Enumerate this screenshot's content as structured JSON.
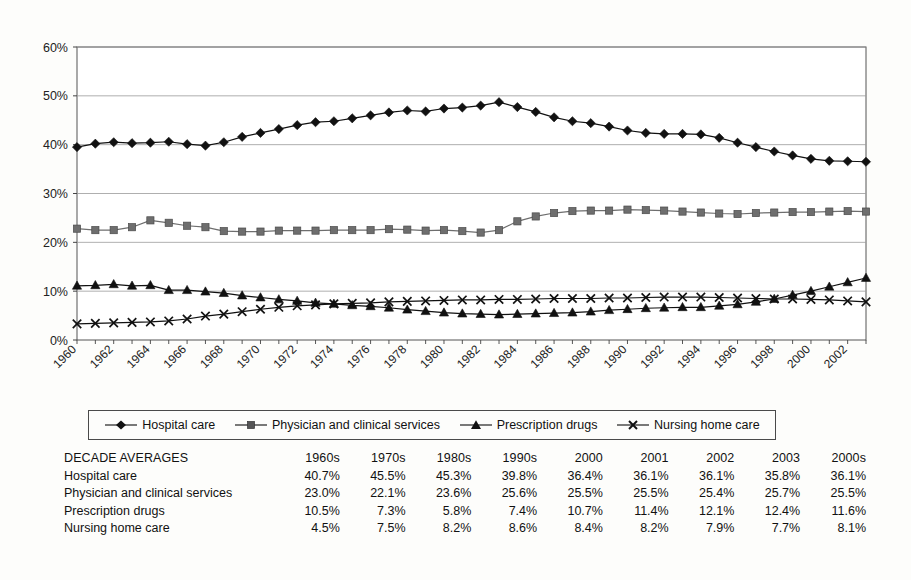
{
  "chart_data": {
    "type": "line",
    "title": "",
    "subtitle": "",
    "xlabel": "",
    "ylabel": "",
    "xlim": [
      1960,
      2003
    ],
    "ylim": [
      0,
      60
    ],
    "yticks": [
      "0%",
      "10%",
      "20%",
      "30%",
      "40%",
      "50%",
      "60%"
    ],
    "ytick_values": [
      0,
      10,
      20,
      30,
      40,
      50,
      60
    ],
    "grid": true,
    "legend_position": "below-plot",
    "x": [
      1960,
      1961,
      1962,
      1963,
      1964,
      1965,
      1966,
      1967,
      1968,
      1969,
      1970,
      1971,
      1972,
      1973,
      1974,
      1975,
      1976,
      1977,
      1978,
      1979,
      1980,
      1981,
      1982,
      1983,
      1984,
      1985,
      1986,
      1987,
      1988,
      1989,
      1990,
      1991,
      1992,
      1993,
      1994,
      1995,
      1996,
      1997,
      1998,
      1999,
      2000,
      2001,
      2002,
      2003
    ],
    "xtick_labels": [
      "1960",
      "1962",
      "1964",
      "1966",
      "1968",
      "1970",
      "1972",
      "1974",
      "1976",
      "1978",
      "1980",
      "1982",
      "1984",
      "1986",
      "1988",
      "1990",
      "1992",
      "1994",
      "1996",
      "1998",
      "2000",
      "2002"
    ],
    "series": [
      {
        "name": "Hospital care",
        "marker": "diamond",
        "color": "#111111",
        "values": [
          39.5,
          40.2,
          40.5,
          40.3,
          40.4,
          40.6,
          40.1,
          39.8,
          40.5,
          41.6,
          42.4,
          43.2,
          44.0,
          44.6,
          44.8,
          45.4,
          46.0,
          46.6,
          47.0,
          46.8,
          47.4,
          47.6,
          48.0,
          48.7,
          47.7,
          46.7,
          45.6,
          44.8,
          44.4,
          43.7,
          42.9,
          42.4,
          42.2,
          42.2,
          42.1,
          41.4,
          40.4,
          39.5,
          38.6,
          37.8,
          37.1,
          36.7,
          36.6,
          36.5
        ]
      },
      {
        "name": "Physician and clinical services",
        "marker": "square",
        "color": "#6e6e6e",
        "values": [
          22.8,
          22.5,
          22.5,
          23.1,
          24.5,
          24.0,
          23.4,
          23.1,
          22.3,
          22.2,
          22.2,
          22.4,
          22.4,
          22.4,
          22.5,
          22.5,
          22.5,
          22.7,
          22.6,
          22.4,
          22.5,
          22.3,
          22.0,
          22.5,
          24.3,
          25.3,
          26.0,
          26.4,
          26.5,
          26.5,
          26.7,
          26.6,
          26.5,
          26.3,
          26.1,
          25.9,
          25.8,
          26.0,
          26.1,
          26.2,
          26.2,
          26.3,
          26.4,
          26.3
        ]
      },
      {
        "name": "Prescription drugs",
        "marker": "triangle",
        "color": "#111111",
        "values": [
          11.1,
          11.2,
          11.4,
          11.1,
          11.2,
          10.2,
          10.2,
          9.9,
          9.6,
          9.1,
          8.7,
          8.3,
          8.0,
          7.6,
          7.4,
          7.1,
          6.9,
          6.6,
          6.2,
          5.9,
          5.6,
          5.4,
          5.3,
          5.2,
          5.3,
          5.4,
          5.5,
          5.6,
          5.8,
          6.1,
          6.3,
          6.5,
          6.6,
          6.7,
          6.7,
          7.0,
          7.3,
          7.8,
          8.4,
          9.2,
          10.0,
          10.9,
          11.8,
          12.7
        ]
      },
      {
        "name": "Nursing home care",
        "marker": "x",
        "color": "#111111",
        "values": [
          3.3,
          3.4,
          3.5,
          3.6,
          3.7,
          3.9,
          4.3,
          4.9,
          5.3,
          5.8,
          6.3,
          6.7,
          7.0,
          7.2,
          7.4,
          7.5,
          7.6,
          7.8,
          7.9,
          8.0,
          8.1,
          8.2,
          8.2,
          8.3,
          8.3,
          8.4,
          8.5,
          8.5,
          8.5,
          8.6,
          8.6,
          8.7,
          8.8,
          8.8,
          8.8,
          8.7,
          8.6,
          8.5,
          8.4,
          8.4,
          8.3,
          8.2,
          8.0,
          7.8
        ]
      }
    ]
  },
  "legend": {
    "items": [
      {
        "label": "Hospital care",
        "marker": "diamond"
      },
      {
        "label": "Physician and clinical services",
        "marker": "square"
      },
      {
        "label": "Prescription drugs",
        "marker": "triangle"
      },
      {
        "label": "Nursing home care",
        "marker": "x"
      }
    ]
  },
  "table": {
    "title": "DECADE AVERAGES",
    "columns": [
      "1960s",
      "1970s",
      "1980s",
      "1990s",
      "2000",
      "2001",
      "2002",
      "2003",
      "2000s"
    ],
    "rows": [
      {
        "label": "Hospital care",
        "values": [
          "40.7%",
          "45.5%",
          "45.3%",
          "39.8%",
          "36.4%",
          "36.1%",
          "36.1%",
          "35.8%",
          "36.1%"
        ]
      },
      {
        "label": "Physician and clinical services",
        "values": [
          "23.0%",
          "22.1%",
          "23.6%",
          "25.6%",
          "25.5%",
          "25.5%",
          "25.4%",
          "25.7%",
          "25.5%"
        ]
      },
      {
        "label": "Prescription drugs",
        "values": [
          "10.5%",
          "7.3%",
          "5.8%",
          "7.4%",
          "10.7%",
          "11.4%",
          "12.1%",
          "12.4%",
          "11.6%"
        ]
      },
      {
        "label": "Nursing home care",
        "values": [
          "4.5%",
          "7.5%",
          "8.2%",
          "8.6%",
          "8.4%",
          "8.2%",
          "7.9%",
          "7.7%",
          "8.1%"
        ]
      }
    ]
  }
}
